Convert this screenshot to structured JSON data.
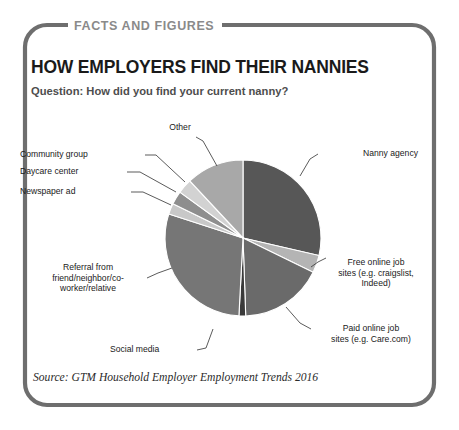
{
  "card": {
    "kicker": "FACTS AND FIGURES",
    "title": "HOW EMPLOYERS FIND THEIR NANNIES",
    "question": "Question: How did you find your current nanny?",
    "source": "Source: GTM Household Employer Employment Trends 2016",
    "border_color": "#6e6e6e",
    "kicker_color": "#8a8a8a",
    "title_color": "#1a1a1a",
    "question_color": "#4d4d4d"
  },
  "chart_data": {
    "type": "pie",
    "title": "HOW EMPLOYERS FIND THEIR NANNIES",
    "subtitle": "Question: How did you find your current nanny?",
    "legend": "labels-with-leader-lines",
    "grid": false,
    "categories": [
      "Nanny agency",
      "Free online job sites (e.g. craigslist, Indeed)",
      "Paid online job sites (e.g. Care.com)",
      "Social media",
      "Referral from friend/neighbor/co-worker/relative",
      "Newspaper ad",
      "Daycare center",
      "Community group",
      "Other"
    ],
    "values": [
      28.6,
      3.6,
      17.2,
      1.4,
      29.2,
      2.2,
      2.8,
      3.1,
      11.9
    ],
    "colors": [
      "#575757",
      "#b4b4b4",
      "#6a6a6a",
      "#3a3a3a",
      "#767676",
      "#c8c8c8",
      "#8e8e8e",
      "#d2d2d2",
      "#a8a8a8"
    ],
    "slices": [
      {
        "label": "Nanny agency",
        "value": 28.6,
        "start_deg": 0,
        "end_deg": 103,
        "color": "#575757"
      },
      {
        "label": "Free online job sites (e.g. craigslist, Indeed)",
        "value": 3.6,
        "start_deg": 103,
        "end_deg": 116,
        "color": "#b4b4b4"
      },
      {
        "label": "Paid online job sites (e.g. Care.com)",
        "value": 17.2,
        "start_deg": 116,
        "end_deg": 178,
        "color": "#6a6a6a"
      },
      {
        "label": "Social media",
        "value": 1.4,
        "start_deg": 178,
        "end_deg": 183,
        "color": "#3a3a3a"
      },
      {
        "label": "Referral from friend/neighbor/co-worker/relative",
        "value": 29.2,
        "start_deg": 183,
        "end_deg": 288,
        "color": "#767676"
      },
      {
        "label": "Newspaper ad",
        "value": 2.2,
        "start_deg": 288,
        "end_deg": 296,
        "color": "#c8c8c8"
      },
      {
        "label": "Daycare center",
        "value": 2.8,
        "start_deg": 296,
        "end_deg": 306,
        "color": "#8e8e8e"
      },
      {
        "label": "Community group",
        "value": 3.1,
        "start_deg": 306,
        "end_deg": 317,
        "color": "#d2d2d2"
      },
      {
        "label": "Other",
        "value": 11.9,
        "start_deg": 317,
        "end_deg": 360,
        "color": "#a8a8a8"
      }
    ]
  },
  "labels": {
    "other": "Other",
    "community_group": "Community group",
    "daycare_center": "Daycare center",
    "newspaper_ad": "Newspaper ad",
    "referral": "Referral from\nfriend/neighbor/co-\nworker/relative",
    "social_media": "Social media",
    "nanny_agency": "Nanny agency",
    "free_online": "Free online job\nsites (e.g. craigslist,\nIndeed)",
    "paid_online": "Paid online job\nsites (e.g. Care.com)"
  }
}
